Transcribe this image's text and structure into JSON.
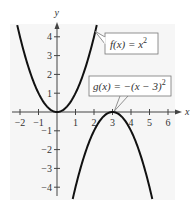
{
  "chart_data": {
    "type": "line",
    "title": "",
    "xlabel": "x",
    "ylabel": "y",
    "xlim": [
      -2.5,
      6.5
    ],
    "ylim": [
      -4.5,
      4.6
    ],
    "grid": false,
    "x_ticks": [
      -2,
      -1,
      1,
      2,
      3,
      4,
      5,
      6
    ],
    "x_tick_labels": [
      "−2",
      "−1",
      "1",
      "2",
      "3",
      "4",
      "5",
      "6"
    ],
    "y_ticks": [
      4,
      3,
      2,
      1,
      -1,
      -2,
      -3,
      -4
    ],
    "y_tick_labels": [
      "4",
      "3",
      "2",
      "1",
      "−1",
      "−2",
      "−3",
      "−4"
    ],
    "series": [
      {
        "name": "f(x) = x^2",
        "label": "f(x) = x",
        "label_exponent": "2",
        "expression": "x^2",
        "x_range": [
          -2.15,
          2.15
        ],
        "vertex": [
          0,
          0
        ],
        "callout_anchor": [
          2.05,
          4.3
        ]
      },
      {
        "name": "g(x) = −(x − 3)^2",
        "label": "g(x) = −(x − 3)",
        "label_exponent": "2",
        "expression": "-(x-3)^2",
        "x_range": [
          0.85,
          5.15
        ],
        "vertex": [
          3,
          0
        ],
        "callout_anchor": [
          3.1,
          0.05
        ]
      }
    ],
    "colors": {
      "curve": "#111111",
      "axis": "#444444",
      "plot_background": "#f6f6f6",
      "callout_border": "#777777"
    }
  }
}
